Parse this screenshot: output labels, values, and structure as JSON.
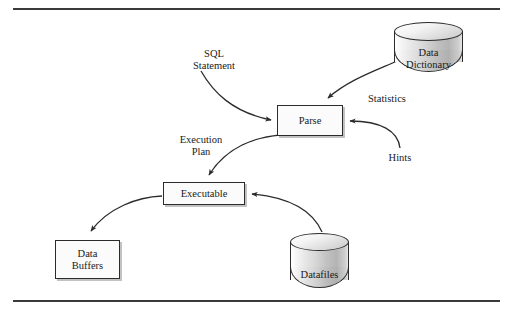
{
  "figure": {
    "type": "flow-diagram",
    "rules": {
      "top": "horizontal-rule",
      "bottom": "horizontal-rule"
    }
  },
  "nodes": {
    "parse": {
      "label": "Parse",
      "shape": "rectangle"
    },
    "executable": {
      "label": "Executable",
      "shape": "rectangle"
    },
    "data_buffers": {
      "line1": "Data",
      "line2": "Buffers",
      "shape": "rectangle"
    },
    "data_dictionary": {
      "line1": "Data",
      "line2": "Dictionary",
      "shape": "cylinder"
    },
    "datafiles": {
      "line1": "Datafiles",
      "shape": "cylinder"
    }
  },
  "edge_labels": {
    "sql_statement": {
      "line1": "SQL",
      "line2": "Statement"
    },
    "statistics": {
      "line1": "Statistics"
    },
    "hints": {
      "line1": "Hints"
    },
    "execution_plan": {
      "line1": "Execution",
      "line2": "Plan"
    }
  },
  "edges": [
    {
      "name": "sql-statement-to-parse",
      "from": "SQL Statement",
      "to": "Parse",
      "style": "curved-arrow"
    },
    {
      "name": "data-dictionary-to-parse",
      "from": "Data Dictionary",
      "to": "Parse",
      "style": "curved-arrow"
    },
    {
      "name": "hints-to-parse",
      "from": "Hints",
      "to": "Parse",
      "style": "curved-arrow"
    },
    {
      "name": "parse-to-executable",
      "from": "Parse",
      "to": "Executable",
      "style": "curved-arrow"
    },
    {
      "name": "executable-to-data-buffers",
      "from": "Executable",
      "to": "Data Buffers",
      "style": "curved-arrow"
    },
    {
      "name": "datafiles-to-executable",
      "from": "Datafiles",
      "to": "Executable",
      "style": "curved-arrow"
    }
  ],
  "colors": {
    "stroke": "#2b2b2b",
    "rule": "#3a3a3a",
    "text": "#1a1a1a",
    "box_fill": "#fbfbfb",
    "cylinder_fill": "#d0d0d0",
    "page_background": "#ffffff"
  }
}
